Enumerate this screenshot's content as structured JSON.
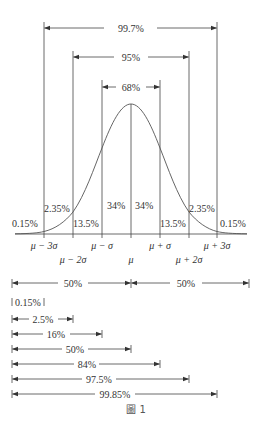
{
  "figure": {
    "caption": "圖 1",
    "top_spans": [
      {
        "label": "99.7%"
      },
      {
        "label": "95%"
      },
      {
        "label": "68%"
      }
    ],
    "region_labels": {
      "left_tail": "0.15%",
      "left_2_3": "2.35%",
      "left_1_2": "13.5%",
      "left_0_1": "34%",
      "right_0_1": "34%",
      "right_1_2": "13.5%",
      "right_2_3": "2.35%",
      "right_tail": "0.15%"
    },
    "axis_labels": {
      "m3": "μ − 3σ",
      "m2": "μ − 2σ",
      "m1": "μ − σ",
      "mu": "μ",
      "p1": "μ + σ",
      "p2": "μ + 2σ",
      "p3": "μ + 3σ"
    },
    "half_spans": {
      "left": "50%",
      "right": "50%"
    },
    "cumulative": [
      {
        "label": "0.15%"
      },
      {
        "label": "2.5%"
      },
      {
        "label": "16%"
      },
      {
        "label": "50%"
      },
      {
        "label": "84%"
      },
      {
        "label": "97.5%"
      },
      {
        "label": "99.85%"
      }
    ]
  }
}
